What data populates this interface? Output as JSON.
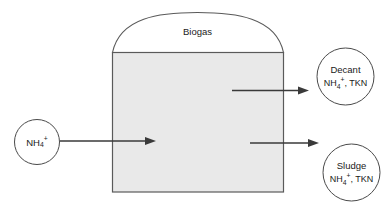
{
  "diagram": {
    "background_color": "#ffffff",
    "tank": {
      "fill_color": "#e9e9e9",
      "stroke_color": "#5a5a5a",
      "dome_fill_color": "#ffffff",
      "dome_label": "Biogas"
    },
    "nodes": [
      {
        "id": "influent",
        "label_main": "NH",
        "label_sub": "4",
        "label_sup": "+",
        "label_rest": "",
        "shape": "circle"
      },
      {
        "id": "decant",
        "line1": "Decant",
        "label_main": "NH",
        "label_sub": "4",
        "label_sup": "+",
        "label_rest": ", TKN",
        "shape": "circle"
      },
      {
        "id": "sludge",
        "line1": "Sludge",
        "label_main": "NH",
        "label_sub": "4",
        "label_sup": "+",
        "label_rest": ", TKN",
        "shape": "circle"
      }
    ],
    "arrows": [
      {
        "id": "influent-to-tank",
        "direction": "right",
        "color": "#3a3a3a"
      },
      {
        "id": "tank-to-decant",
        "direction": "right",
        "color": "#3a3a3a"
      },
      {
        "id": "tank-to-sludge",
        "direction": "right",
        "color": "#3a3a3a"
      }
    ]
  }
}
